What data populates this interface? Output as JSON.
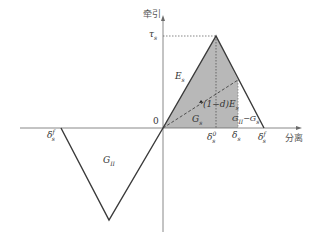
{
  "diagram": {
    "type": "traction-separation law (bilinear cohesive law)",
    "axes": {
      "y_label": "牵引",
      "x_label": "分离",
      "origin_label": "0"
    },
    "labels": {
      "tau_s": "τ",
      "tau_s_sub": "s",
      "E_s": "E",
      "E_s_sub": "s",
      "damaged_stiffness": "(1−d)E",
      "damaged_stiffness_sub": "s",
      "G_s": "G",
      "G_s_sub": "s",
      "G_II_minus_G_s": "G",
      "G_II_minus_G_s_sub": "II",
      "G_II_minus_G_s_tail": "−G",
      "G_II_minus_G_s_tail_sub": "s",
      "G_II": "G",
      "G_II_sub": "II",
      "delta_s0": "δ",
      "delta_s0_sup": "0",
      "delta_s0_sub": "s",
      "delta_s": "δ",
      "delta_s_sub": "s",
      "delta_sf": "δ",
      "delta_sf_sup": "f",
      "delta_sf_sub": "s",
      "delta_sf_neg": "δ",
      "delta_sf_neg_sup": "f",
      "delta_sf_neg_sub": "s"
    },
    "colors": {
      "line": "#3a3a3a",
      "fill": "#b8b8b8",
      "axis": "#6a6a6a",
      "background": "#ffffff"
    }
  }
}
